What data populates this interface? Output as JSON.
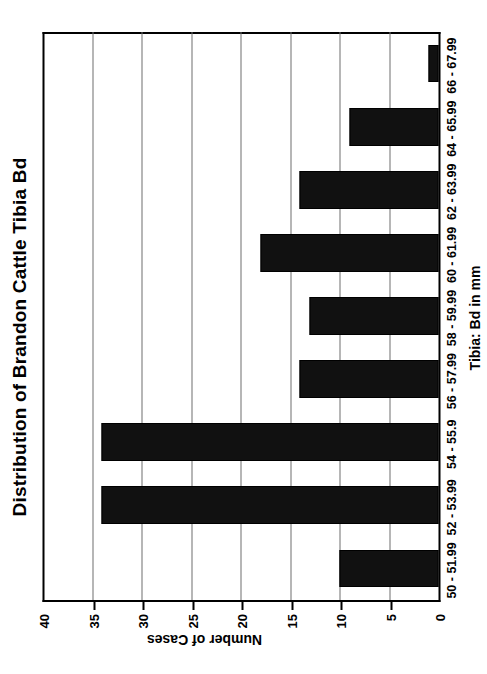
{
  "chart_data": {
    "type": "bar",
    "orientation": "rotated-90-ccw",
    "title": "Distribution of Brandon Cattle Tibia Bd",
    "xlabel": "Tibia: Bd in mm",
    "ylabel": "Number of Cases",
    "categories": [
      "50 - 51.99",
      "52 - 53.99",
      "54 - 55.9",
      "56 - 57.99",
      "58 - 59.99",
      "60 - 61.99",
      "62 - 63.99",
      "64 - 65.99",
      "66 - 67.99"
    ],
    "values": [
      10,
      34,
      34,
      14,
      13,
      18,
      14,
      9,
      1
    ],
    "ylim": [
      0,
      40
    ],
    "yticks": [
      0,
      5,
      10,
      15,
      20,
      25,
      30,
      35,
      40
    ],
    "ytick_labels": [
      "0",
      "5",
      "10",
      "15",
      "20",
      "25",
      "30",
      "35",
      "40"
    ],
    "grid": true,
    "legend": false,
    "bar_color": "#111111",
    "grid_color": "#6e6e6e",
    "axis_color": "#000000",
    "background_color": "#ffffff"
  }
}
